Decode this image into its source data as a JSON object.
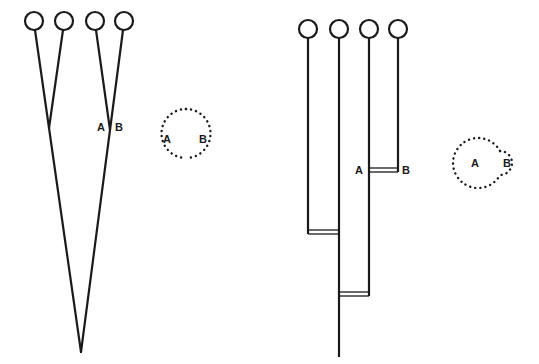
{
  "diagram": {
    "type": "phylogenetic-tree-comparison",
    "line_color": "#1a1a1a",
    "left_panel": {
      "kind": "diverging-tree",
      "tips": [
        {
          "x": 34,
          "y": 21
        },
        {
          "x": 64,
          "y": 21
        },
        {
          "x": 95,
          "y": 21
        },
        {
          "x": 124,
          "y": 21
        }
      ],
      "internal_nodes": [
        {
          "x": 49,
          "y": 128
        },
        {
          "x": 110,
          "y": 130
        }
      ],
      "root": {
        "x": 81,
        "y": 352
      },
      "labels": {
        "a": "A",
        "b": "B"
      },
      "venn": {
        "a_label": "A",
        "b_label": "B",
        "description": "two equal overlapping dotted circles"
      }
    },
    "right_panel": {
      "kind": "rectangular-tree-with-double-line-joins",
      "tips": [
        {
          "x": 308,
          "y": 29
        },
        {
          "x": 339,
          "y": 29
        },
        {
          "x": 369,
          "y": 29
        },
        {
          "x": 398,
          "y": 29
        }
      ],
      "joins_y": [
        170,
        232,
        294
      ],
      "root_bottom_y": 357,
      "labels": {
        "a": "A",
        "b": "B"
      },
      "venn": {
        "a_label": "A",
        "b_label": "B",
        "description": "large dotted circle A overlapping small dotted circle B"
      }
    }
  }
}
